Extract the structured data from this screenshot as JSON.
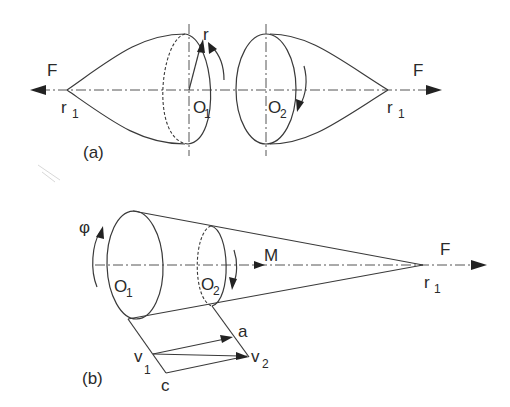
{
  "figure": {
    "panel_a": {
      "label": "(a)",
      "left_force": {
        "F": "F",
        "apex": "r",
        "apex_sub": "1"
      },
      "left_body_center": {
        "O": "O",
        "sub": "1"
      },
      "radius_label": "r",
      "right_body_center": {
        "O": "O",
        "sub": "2"
      },
      "right_force": {
        "F": "F",
        "apex": "r",
        "apex_sub": "1"
      }
    },
    "panel_b": {
      "label": "(b)",
      "rotation_label": "φ",
      "left_center": {
        "O": "O",
        "sub": "1"
      },
      "right_center": {
        "O": "O",
        "sub": "2"
      },
      "moment_label": "M",
      "apex": {
        "F": "F",
        "r": "r",
        "sub": "1"
      },
      "vectors": {
        "v1": {
          "v": "v",
          "sub": "1"
        },
        "v2": {
          "v": "v",
          "sub": "2"
        },
        "a": "a",
        "c": "c"
      }
    }
  },
  "colors": {
    "line": "#3a3a3a",
    "text": "#2a2a2a",
    "background": "#ffffff"
  }
}
